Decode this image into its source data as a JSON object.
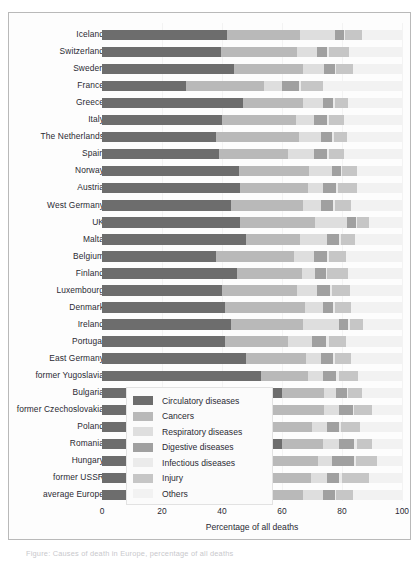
{
  "chart_data": {
    "type": "bar",
    "orientation": "horizontal",
    "stacked": true,
    "title": "",
    "xlabel": "Percentage of all deaths",
    "ylabel": "",
    "xlim": [
      0,
      100
    ],
    "xticks": [
      0,
      20,
      40,
      60,
      80,
      100
    ],
    "grid": true,
    "legend_position": "lower-center-inside",
    "categories": [
      "Iceland",
      "Switzerland",
      "Sweden",
      "France",
      "Greece",
      "Italy",
      "The Netherlands",
      "Spain",
      "Norway",
      "Austria",
      "West Germany",
      "UK",
      "Malta",
      "Belgium",
      "Finland",
      "Luxembourg",
      "Denmark",
      "Ireland",
      "Portugal",
      "East Germany",
      "former Yugoslavia",
      "Bulgaria",
      "former Czechoslovakia",
      "Poland",
      "Romania",
      "Hungary",
      "former USSR",
      "average Europe"
    ],
    "series": [
      {
        "name": "Circulatory diseases",
        "color": "#6d6d6d",
        "values": [
          41.5,
          39.5,
          44.0,
          28.0,
          47.0,
          40.0,
          38.0,
          39.0,
          45.5,
          46.0,
          43.0,
          46.0,
          48.0,
          38.0,
          45.0,
          40.0,
          41.0,
          43.0,
          41.0,
          48.0,
          53.0,
          60.0,
          55.0,
          52.0,
          60.0,
          51.0,
          56.0,
          45.5
        ]
      },
      {
        "name": "Cancers",
        "color": "#b9b9b9",
        "values": [
          24.5,
          25.5,
          23.0,
          26.0,
          20.0,
          24.5,
          27.5,
          23.0,
          23.5,
          22.5,
          24.0,
          25.0,
          18.0,
          26.0,
          21.5,
          25.0,
          26.5,
          24.0,
          21.0,
          20.0,
          15.5,
          14.0,
          19.0,
          18.0,
          13.5,
          21.0,
          13.5,
          21.5
        ]
      },
      {
        "name": "Respiratory diseases",
        "color": "#dedede",
        "values": [
          11.5,
          6.5,
          7.0,
          6.0,
          6.5,
          6.0,
          7.5,
          8.5,
          7.5,
          5.0,
          6.0,
          10.5,
          9.0,
          6.5,
          4.5,
          6.5,
          6.0,
          12.0,
          8.0,
          5.0,
          5.0,
          4.0,
          5.0,
          5.0,
          5.5,
          4.5,
          5.5,
          6.5
        ]
      },
      {
        "name": "Digestive diseases",
        "color": "#a0a0a0",
        "values": [
          3.0,
          3.5,
          3.5,
          5.5,
          3.5,
          4.5,
          3.5,
          4.5,
          3.0,
          4.5,
          4.0,
          3.0,
          4.0,
          4.5,
          3.5,
          4.5,
          3.5,
          3.0,
          4.5,
          4.0,
          4.5,
          3.5,
          4.5,
          4.0,
          5.0,
          7.5,
          4.0,
          4.0
        ]
      },
      {
        "name": "Infectious diseases",
        "color": "#ebebeb",
        "values": [
          0.5,
          0.7,
          0.6,
          0.8,
          0.6,
          0.6,
          0.7,
          0.7,
          0.5,
          0.6,
          0.6,
          0.5,
          0.8,
          0.7,
          0.5,
          0.6,
          0.6,
          0.5,
          1.2,
          0.5,
          0.9,
          0.6,
          0.6,
          0.6,
          0.9,
          0.6,
          1.0,
          0.6
        ]
      },
      {
        "name": "Injury",
        "color": "#c6c6c6",
        "values": [
          5.5,
          6.5,
          5.5,
          7.5,
          4.5,
          5.0,
          4.5,
          5.0,
          5.0,
          6.5,
          5.5,
          4.0,
          4.5,
          5.5,
          7.0,
          6.0,
          5.5,
          4.5,
          5.5,
          5.5,
          6.5,
          4.5,
          6.0,
          6.5,
          5.0,
          7.0,
          9.0,
          5.5
        ]
      },
      {
        "name": "Others",
        "color": "#f2f2f2",
        "values": [
          13.5,
          17.8,
          16.4,
          26.2,
          17.9,
          19.4,
          18.3,
          19.3,
          15.0,
          14.9,
          16.9,
          11.0,
          15.7,
          18.8,
          18.0,
          17.4,
          16.9,
          13.0,
          18.8,
          17.0,
          14.6,
          13.4,
          9.9,
          13.9,
          10.1,
          8.4,
          11.0,
          16.4
        ]
      }
    ]
  },
  "legend": {
    "items": [
      {
        "label": "Circulatory diseases",
        "color": "#6d6d6d"
      },
      {
        "label": "Cancers",
        "color": "#b9b9b9"
      },
      {
        "label": "Respiratory diseases",
        "color": "#dedede"
      },
      {
        "label": "Digestive diseases",
        "color": "#a0a0a0"
      },
      {
        "label": "Infectious diseases",
        "color": "#ebebeb"
      },
      {
        "label": "Injury",
        "color": "#c6c6c6"
      },
      {
        "label": "Others",
        "color": "#f2f2f2"
      }
    ]
  },
  "caption": "Figure: Causes of death in Europe, percentage of all deaths"
}
